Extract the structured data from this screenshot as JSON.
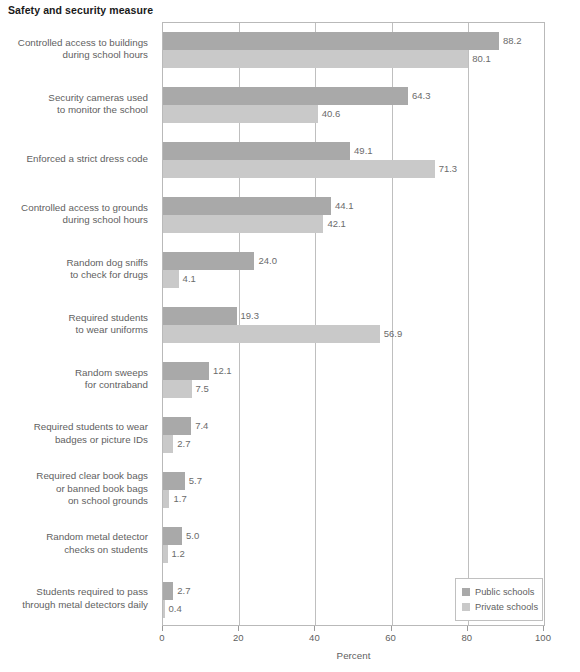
{
  "chart_data": {
    "type": "bar",
    "orientation": "horizontal",
    "title": "Safety and security measure",
    "xlabel": "Percent",
    "ylabel": "",
    "xlim": [
      0,
      100
    ],
    "xticks": [
      0,
      20,
      40,
      60,
      80,
      100
    ],
    "xtick_labels": [
      "0",
      "20",
      "40",
      "60",
      "80",
      "100"
    ],
    "grid": true,
    "legend_position": "bottom-right",
    "colors": {
      "public": "#a9a9a9",
      "private": "#c9c9c9",
      "axis": "#b9b9b9",
      "text": "#5f5f5f",
      "title": "#1a1a1a"
    },
    "categories": [
      "Controlled access to buildings\nduring school hours",
      "Security cameras used\nto monitor the school",
      "Enforced a strict dress code",
      "Controlled access to grounds\nduring school hours",
      "Random dog sniffs\nto check for drugs",
      "Required students\nto wear uniforms",
      "Random sweeps\nfor contraband",
      "Required students to wear\nbadges or picture IDs",
      "Required clear book bags\nor banned book bags\non school grounds",
      "Random metal detector\nchecks on students",
      "Students required to pass\nthrough metal detectors daily"
    ],
    "series": [
      {
        "name": "Public schools",
        "values": [
          88.2,
          64.3,
          49.1,
          44.1,
          24.0,
          19.3,
          12.1,
          7.4,
          5.7,
          5.0,
          2.7
        ],
        "value_labels": [
          "88.2",
          "64.3",
          "49.1",
          "44.1",
          "24.0",
          "19.3",
          "12.1",
          "7.4",
          "5.7",
          "5.0",
          "2.7"
        ]
      },
      {
        "name": "Private schools",
        "values": [
          80.1,
          40.6,
          71.3,
          42.1,
          4.1,
          56.9,
          7.5,
          2.7,
          1.7,
          1.2,
          0.4
        ],
        "value_labels": [
          "80.1",
          "40.6",
          "71.3",
          "42.1",
          "4.1",
          "56.9",
          "7.5",
          "2.7",
          "1.7",
          "1.2",
          "0.4"
        ]
      }
    ]
  },
  "legend": {
    "items": [
      {
        "label": "Public schools",
        "swatch": "public"
      },
      {
        "label": "Private schools",
        "swatch": "private"
      }
    ]
  }
}
